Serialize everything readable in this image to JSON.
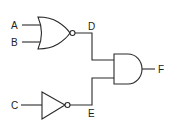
{
  "diagram": {
    "type": "logic-circuit",
    "inputs": [
      {
        "id": "A",
        "label": "A"
      },
      {
        "id": "B",
        "label": "B"
      },
      {
        "id": "C",
        "label": "C"
      }
    ],
    "intermediate": [
      {
        "id": "D",
        "label": "D",
        "from": "NOR(A,B)"
      },
      {
        "id": "E",
        "label": "E",
        "from": "NOT(C)"
      }
    ],
    "output": {
      "id": "F",
      "label": "F",
      "from": "AND(D,E)"
    },
    "gates": [
      {
        "type": "NOR",
        "inputs": [
          "A",
          "B"
        ],
        "output": "D"
      },
      {
        "type": "NOT",
        "inputs": [
          "C"
        ],
        "output": "E"
      },
      {
        "type": "AND",
        "inputs": [
          "D",
          "E"
        ],
        "output": "F"
      }
    ],
    "colors": {
      "line": "#2a2a2a",
      "background": "#ffffff"
    }
  }
}
